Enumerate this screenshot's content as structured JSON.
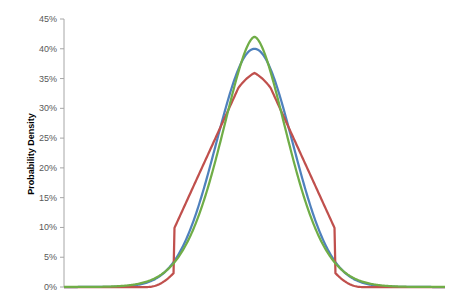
{
  "chart_data": {
    "type": "line",
    "title": "",
    "xlabel": "",
    "ylabel": "Probability Density",
    "ylim": [
      0,
      0.45
    ],
    "yticks": [
      "0%",
      "5%",
      "10%",
      "15%",
      "20%",
      "25%",
      "30%",
      "35%",
      "40%",
      "45%"
    ],
    "grid": false,
    "legend": "none",
    "x_range": [
      -5,
      5
    ],
    "series": [
      {
        "name": "Blue curve (normal)",
        "color": "#4f81bd",
        "peak": 0.4,
        "shape": "normal",
        "sigma": 1.0
      },
      {
        "name": "Red curve",
        "color": "#c0504d",
        "peak": 0.37,
        "shape": "triangular-smooth",
        "sigma": 1.08
      },
      {
        "name": "Green curve",
        "color": "#70ad47",
        "peak": 0.42,
        "shape": "peaked",
        "sigma": 0.95
      }
    ]
  }
}
